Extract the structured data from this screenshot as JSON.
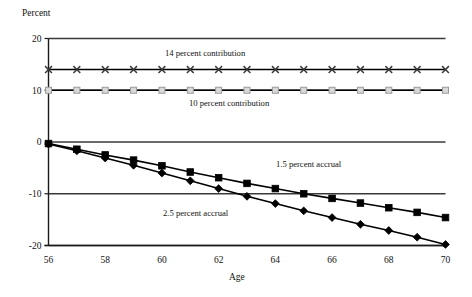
{
  "chart_data": {
    "type": "line",
    "title": "",
    "xlabel": "Age",
    "ylabel": "Percent",
    "x": [
      56,
      57,
      58,
      59,
      60,
      61,
      62,
      63,
      64,
      65,
      66,
      67,
      68,
      69,
      70
    ],
    "xlim": [
      56,
      70
    ],
    "ylim": [
      -20,
      20
    ],
    "xticks": [
      56,
      58,
      60,
      62,
      64,
      66,
      68,
      70
    ],
    "xtick_labels": [
      "56",
      "58",
      "60",
      "62",
      "64",
      "66",
      "68",
      "70"
    ],
    "yticks": [
      20,
      10,
      0,
      -10,
      -20
    ],
    "ytick_labels": [
      "20",
      "10",
      "0",
      "-10",
      "-20"
    ],
    "grid": "horizontal",
    "legend": "none",
    "series": [
      {
        "name": "14 percent contribution",
        "marker": "cross",
        "color": "#000000",
        "values": [
          14,
          14,
          14,
          14,
          14,
          14,
          14,
          14,
          14,
          14,
          14,
          14,
          14,
          14,
          14
        ]
      },
      {
        "name": "10 percent contribution",
        "marker": "light-square",
        "color": "#000000",
        "values": [
          10,
          10,
          10,
          10,
          10,
          10,
          10,
          10,
          10,
          10,
          10,
          10,
          10,
          10,
          10
        ]
      },
      {
        "name": "1.5 percent accrual",
        "marker": "square",
        "color": "#000000",
        "values": [
          -0.3,
          -1.4,
          -2.5,
          -3.5,
          -4.6,
          -5.8,
          -6.9,
          -8.0,
          -9.0,
          -10.0,
          -10.9,
          -11.8,
          -12.7,
          -13.6,
          -14.6
        ]
      },
      {
        "name": "2.5 percent accrual",
        "marker": "diamond",
        "color": "#000000",
        "values": [
          -0.4,
          -1.7,
          -3.1,
          -4.5,
          -6.0,
          -7.5,
          -9.0,
          -10.5,
          -11.9,
          -13.3,
          -14.6,
          -15.9,
          -17.1,
          -18.4,
          -19.8
        ]
      }
    ],
    "annotations": [
      {
        "text": "14 percent contribution",
        "x_px": 165,
        "y_px": 56
      },
      {
        "text": "10 percent contribution",
        "x_px": 189,
        "y_px": 106
      },
      {
        "text": "1.5 percent accrual",
        "x_px": 276,
        "y_px": 167
      },
      {
        "text": "2.5 percent accrual",
        "x_px": 163,
        "y_px": 216
      }
    ]
  },
  "colors": {
    "line": "#000000",
    "grid": "#3a3a3a",
    "axis": "#1a1a1a",
    "light_marker_fill": "#d9d9d9",
    "light_marker_stroke": "#9a9a9a",
    "background": "#ffffff"
  }
}
